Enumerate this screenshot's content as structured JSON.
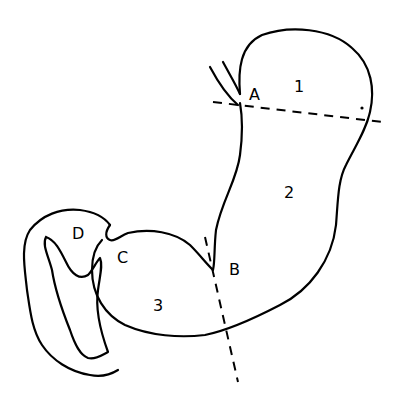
{
  "diagram": {
    "labels": {
      "A": "A",
      "B": "B",
      "C": "C",
      "D": "D",
      "region1": "1",
      "region2": "2",
      "region3": "3"
    }
  }
}
